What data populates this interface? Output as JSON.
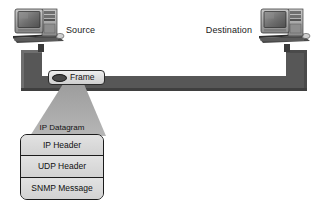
{
  "diagram": {
    "background_color": "#ffffff",
    "bus_color": "#575757",
    "cone_color": "#a8a8a8"
  },
  "nodes": {
    "source": {
      "label": "Source",
      "icon": "desktop-computer-icon"
    },
    "destination": {
      "label": "Destination",
      "icon": "desktop-computer-icon"
    }
  },
  "frame": {
    "label": "Frame",
    "icon": "frame-oval-icon"
  },
  "datagram": {
    "label": "IP Datagram",
    "layers": [
      {
        "label": "IP Header"
      },
      {
        "label": "UDP Header"
      },
      {
        "label": "SNMP Message"
      }
    ]
  }
}
